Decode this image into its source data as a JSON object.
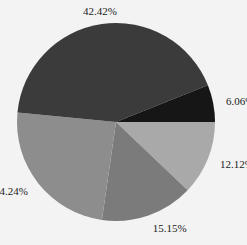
{
  "chart_data": {
    "type": "pie",
    "title": "",
    "start_angle_deg": 0,
    "direction": "clockwise",
    "slices": [
      {
        "label": "12.12%",
        "value": 12.12,
        "color": "#a9a9a9"
      },
      {
        "label": "15.15%",
        "value": 15.15,
        "color": "#7b7b7b"
      },
      {
        "label": "24.24%",
        "value": 24.24,
        "color": "#8d8d8d"
      },
      {
        "label": "42.42%",
        "value": 42.42,
        "color": "#3b3b3b"
      },
      {
        "label": "6.06%",
        "value": 6.06,
        "color": "#161616"
      }
    ],
    "legend": "none"
  },
  "background": "#f3f3f3"
}
